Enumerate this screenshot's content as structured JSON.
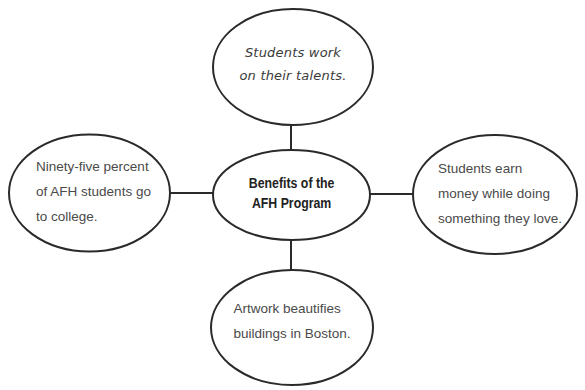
{
  "diagram": {
    "type": "concept-web",
    "center": {
      "lines": [
        "Benefits of the",
        "AFH Program"
      ]
    },
    "nodes": {
      "top": {
        "lines": [
          "Students work",
          "on their talents."
        ]
      },
      "left": {
        "lines": [
          "Ninety-five percent",
          "of AFH students go",
          "to college."
        ]
      },
      "right": {
        "lines": [
          "Students earn",
          "money while doing",
          "something they love."
        ]
      },
      "bottom": {
        "lines": [
          "Artwork beautifies",
          "buildings in Boston."
        ]
      }
    },
    "colors": {
      "stroke": "#2a2a2a",
      "text": "#4a4a4a",
      "background": "#ffffff"
    }
  }
}
